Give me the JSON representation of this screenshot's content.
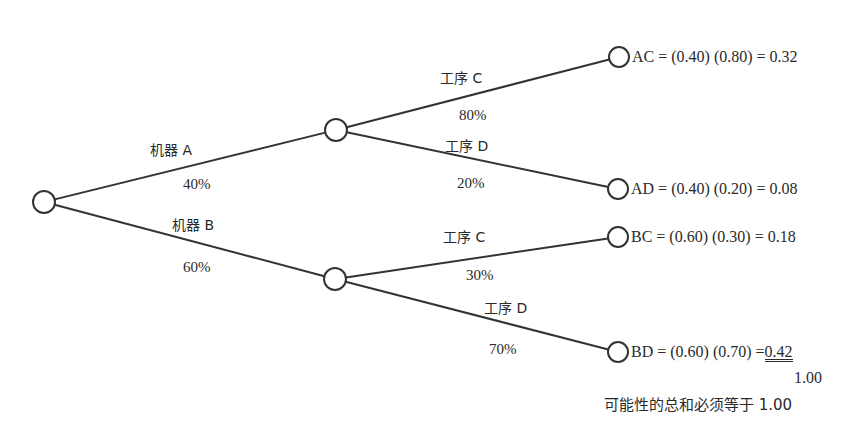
{
  "diagram": {
    "type": "probability-tree",
    "colors": {
      "line": "#333333",
      "node_fill": "#ffffff",
      "text": "#2a2a2a",
      "background": "#ffffff"
    },
    "nodes": [
      {
        "id": "root",
        "x": 44,
        "y": 202,
        "r": 11
      },
      {
        "id": "A",
        "x": 336,
        "y": 130,
        "r": 11
      },
      {
        "id": "B",
        "x": 335,
        "y": 279,
        "r": 11
      },
      {
        "id": "AC",
        "x": 619,
        "y": 57,
        "r": 10
      },
      {
        "id": "AD",
        "x": 618,
        "y": 189,
        "r": 10
      },
      {
        "id": "BC",
        "x": 618,
        "y": 237,
        "r": 10
      },
      {
        "id": "BD",
        "x": 618,
        "y": 352,
        "r": 10
      }
    ],
    "edges": [
      {
        "from": "root",
        "to": "A"
      },
      {
        "from": "root",
        "to": "B"
      },
      {
        "from": "A",
        "to": "AC"
      },
      {
        "from": "A",
        "to": "AD"
      },
      {
        "from": "B",
        "to": "BC"
      },
      {
        "from": "B",
        "to": "BD"
      }
    ],
    "branches": {
      "machine_a": {
        "label": "机器 A",
        "prob": "40%"
      },
      "machine_b": {
        "label": "机器 B",
        "prob": "60%"
      },
      "a_process_c": {
        "label": "工序 C",
        "prob": "80%"
      },
      "a_process_d": {
        "label": "工序 D",
        "prob": "20%"
      },
      "b_process_c": {
        "label": "工序 C",
        "prob": "30%"
      },
      "b_process_d": {
        "label": "工序 D",
        "prob": "70%"
      }
    },
    "outcomes": {
      "ac": {
        "text": "AC = (0.40) (0.80) = 0.32"
      },
      "ad": {
        "text": "AD = (0.40) (0.20) = 0.08"
      },
      "bc": {
        "text": "BC = (0.60) (0.30) = 0.18"
      },
      "bd": {
        "prefix": "BD = (0.60) (0.70) =",
        "value": "0.42"
      }
    },
    "total": "1.00",
    "note": "可能性的总和必须等于 1.00"
  }
}
